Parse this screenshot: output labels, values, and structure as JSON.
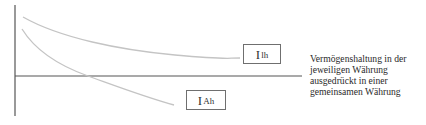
{
  "diagram": {
    "title": "",
    "axes": {
      "color": "#555555",
      "vertical": {
        "x": 15,
        "y_top": 5,
        "y_bottom": 116
      },
      "horizontal": {
        "y": 76,
        "x_left": 15,
        "x_right": 302
      }
    },
    "curves": [
      {
        "id": "ih",
        "label_main": "I",
        "label_sub": "Ih",
        "color": "#c4c4c4",
        "path": "M 23 17 C 60 38, 120 50, 175 55 S 225 58, 240 58"
      },
      {
        "id": "iah",
        "label_main": "I",
        "label_sub": "Ah",
        "color": "#c4c4c4",
        "path": "M 22 29 C 35 50, 60 66, 88 76 S 145 97, 174 105"
      }
    ],
    "labels": {
      "ih": {
        "main": "I",
        "sub": "lh"
      },
      "iah": {
        "main": "I",
        "sub": "Ah"
      }
    },
    "description": {
      "line1": "Vermögenshaltung in der",
      "line2": "jeweiligen Währung",
      "line3": "ausgedrückt in einer",
      "line4": "gemeinsamen Währung"
    }
  }
}
